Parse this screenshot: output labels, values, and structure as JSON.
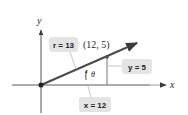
{
  "diagram": {
    "title": "",
    "axes": {
      "x_label": "x",
      "y_label": "y"
    },
    "point": {
      "label": "(12, 5)",
      "x": 12,
      "y": 5
    },
    "angle_label": "θ",
    "callouts": {
      "r": "r = 13",
      "y": "y = 5",
      "x": "x = 12"
    },
    "colors": {
      "axis": "#444444",
      "ray": "#4a4a4a",
      "callout_fill": "#e4e4e4",
      "text": "#222222"
    }
  }
}
